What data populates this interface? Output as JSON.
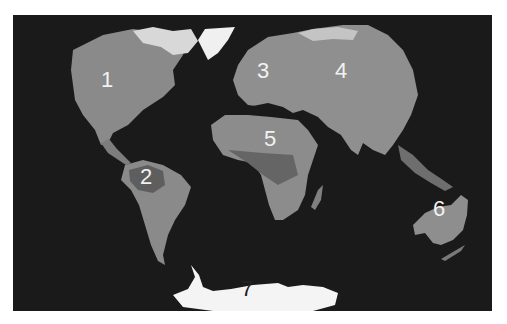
{
  "map": {
    "type": "world-map-grayscale",
    "projection": "elliptical",
    "background_color": "#1a1a1a",
    "land_color": "#8c8c8c",
    "ice_color": "#f4f4f4",
    "regions": [
      {
        "id": 1,
        "label": "1",
        "name": "North America",
        "x": 107,
        "y": 80
      },
      {
        "id": 2,
        "label": "2",
        "name": "South America",
        "x": 146,
        "y": 177
      },
      {
        "id": 3,
        "label": "3",
        "name": "Europe",
        "x": 263,
        "y": 71
      },
      {
        "id": 4,
        "label": "4",
        "name": "Asia",
        "x": 341,
        "y": 71
      },
      {
        "id": 5,
        "label": "5",
        "name": "Africa",
        "x": 270,
        "y": 139
      },
      {
        "id": 6,
        "label": "6",
        "name": "Australia",
        "x": 439,
        "y": 209
      },
      {
        "id": 7,
        "label": "7",
        "name": "Antarctica",
        "x": 247,
        "y": 289
      }
    ]
  }
}
